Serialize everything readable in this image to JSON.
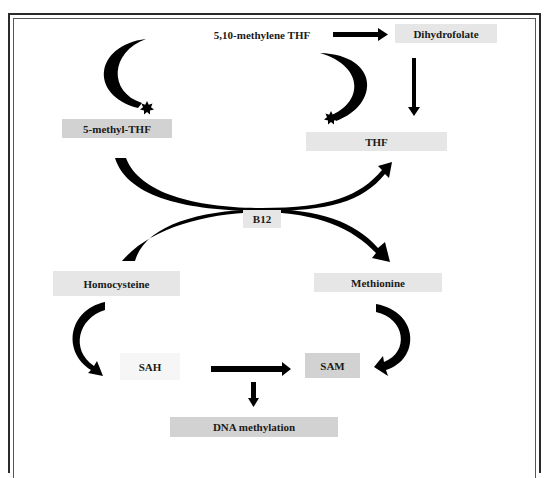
{
  "diagram": {
    "nodes": {
      "methylene_thf": "5,10-methylene THF",
      "dihydrofolate": "Dihydrofolate",
      "methyl_thf": "5-methyl-THF",
      "thf": "THF",
      "b12": "B12",
      "homocysteine": "Homocysteine",
      "methionine": "Methionine",
      "sah": "SAH",
      "sam": "SAM",
      "dna_methylation": "DNA methylation"
    },
    "edges": [
      {
        "from": "5,10-methylene THF",
        "to": "Dihydrofolate"
      },
      {
        "from": "Dihydrofolate",
        "to": "THF"
      },
      {
        "from": "5-methyl-THF",
        "to": "THF",
        "via": "B12"
      },
      {
        "from": "Homocysteine",
        "to": "Methionine",
        "via": "B12"
      },
      {
        "from": "Homocysteine",
        "to": "SAH"
      },
      {
        "from": "Methionine",
        "to": "SAM"
      },
      {
        "from": "SAH",
        "to": "SAM"
      },
      {
        "from": "SAH/SAM",
        "to": "DNA methylation"
      },
      {
        "from": "5,10-methylene THF",
        "to": "5-methyl-THF",
        "shape": "crescent"
      },
      {
        "from": "5,10-methylene THF",
        "to": "THF",
        "shape": "crescent"
      }
    ],
    "colors": {
      "arrow": "#000000",
      "box_light": "#e6e6e6",
      "box_mid": "#d2d2d2",
      "box_faint": "#f6f6f6",
      "frame": "#2a2a2a"
    }
  }
}
